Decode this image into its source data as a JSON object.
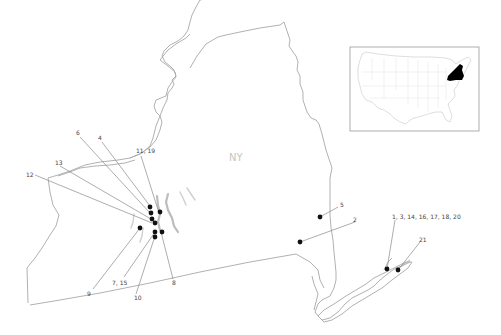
{
  "map": {
    "state_label": "NY",
    "colors": {
      "outline": "#a8a8a8",
      "site_marker": "#111111",
      "leader_line": "#8a8a8a",
      "highlight_state": "#000000"
    },
    "sites": [
      {
        "label": "4"
      },
      {
        "label": "6"
      },
      {
        "label": "11, 19"
      },
      {
        "label": "13"
      },
      {
        "label": "12"
      },
      {
        "label": "9"
      },
      {
        "label": "7, 15"
      },
      {
        "label": "10"
      },
      {
        "label": "8"
      },
      {
        "label": "5"
      },
      {
        "label": "2"
      },
      {
        "label": "1, 3, 14, 16, 17, 18, 20"
      },
      {
        "label": "21"
      }
    ],
    "inset": {
      "description": "US locator map",
      "highlighted_state": "New York"
    }
  }
}
